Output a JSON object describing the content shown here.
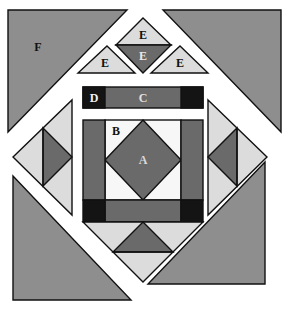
{
  "diagram": {
    "title": "",
    "colors": {
      "background": "#ffffff",
      "medium_gray": "#8e8e8e",
      "dark_gray": "#6a6a6a",
      "light_gray": "#dcdcdc",
      "white": "#f7f7f7",
      "black": "#141414",
      "outline": "#111111"
    },
    "labels": {
      "A": "A",
      "B": "B",
      "C": "C",
      "D": "D",
      "E_top": "E",
      "E_center": "E",
      "E_left": "E",
      "E_right": "E",
      "F": "F"
    },
    "pieces": [
      {
        "id": "F-top-left",
        "shape": "triangle",
        "fill": "medium_gray",
        "label": "F"
      },
      {
        "id": "F-top-right",
        "shape": "triangle",
        "fill": "medium_gray"
      },
      {
        "id": "F-bottom-left",
        "shape": "triangle",
        "fill": "medium_gray"
      },
      {
        "id": "F-bottom-right",
        "shape": "triangle",
        "fill": "medium_gray"
      },
      {
        "id": "E-top",
        "shape": "triangle",
        "fill": "light_gray",
        "label": "E"
      },
      {
        "id": "E-center",
        "shape": "triangle",
        "fill": "dark_gray",
        "label": "E"
      },
      {
        "id": "E-left",
        "shape": "triangle",
        "fill": "light_gray",
        "label": "E"
      },
      {
        "id": "E-right",
        "shape": "triangle",
        "fill": "light_gray",
        "label": "E"
      },
      {
        "id": "D",
        "shape": "square",
        "fill": "black",
        "label": "D"
      },
      {
        "id": "C",
        "shape": "rectangle",
        "fill": "dark_gray",
        "label": "C"
      },
      {
        "id": "B",
        "shape": "triangle",
        "fill": "white",
        "label": "B"
      },
      {
        "id": "A",
        "shape": "square-on-point",
        "fill": "dark_gray",
        "label": "A"
      }
    ]
  }
}
